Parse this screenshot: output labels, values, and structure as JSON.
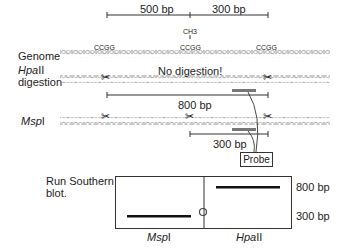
{
  "scale_bar": {
    "left_label": "500 bp",
    "right_label": "300 bp",
    "methyl_label": "CH3"
  },
  "genome": {
    "row_label": "Genome",
    "sites": [
      "CCGG",
      "CCGG",
      "CCGG"
    ]
  },
  "hpaii_row": {
    "label_enzyme": "Hpa",
    "label_suffix": "II",
    "label_line2": "digestion",
    "note": "No digestion!",
    "fragment_label": "800 bp"
  },
  "mspi_row": {
    "label_enzyme": "Msp",
    "label_suffix": "I",
    "fragment_label": "300 bp"
  },
  "probe": {
    "label": "Probe",
    "color": "#777777"
  },
  "southern_blot": {
    "title_line1": "Run Southern",
    "title_line2": "blot.",
    "lanes": [
      {
        "enzyme": "Msp",
        "suffix": "I",
        "band": "300 bp"
      },
      {
        "enzyme": "Hpa",
        "suffix": "II",
        "band": "800 bp"
      }
    ],
    "size_markers": [
      "800 bp",
      "300 bp"
    ]
  },
  "colors": {
    "dna": "#b5b5b5",
    "line": "#333333",
    "band": "#111111"
  }
}
